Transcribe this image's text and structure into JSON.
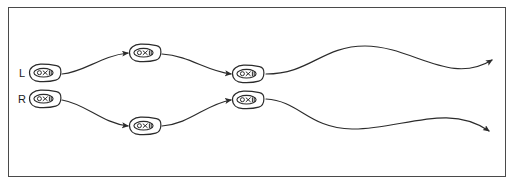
{
  "figure": {
    "background_color": "#ffffff",
    "stroke_color": "#2b2b2b",
    "frame_color": "#4a4a4a",
    "frame": {
      "x": 8,
      "y": 7,
      "width": 498,
      "height": 170
    }
  },
  "labels": {
    "left_input": "L",
    "right_input": "R"
  },
  "nodes": [
    {
      "id": "node-input-l",
      "name": "input-node-l",
      "cx": 45,
      "cy": 73,
      "rx": 15,
      "ry": 8
    },
    {
      "id": "node-input-r",
      "name": "input-node-r",
      "cx": 45,
      "cy": 99,
      "rx": 15,
      "ry": 8
    },
    {
      "id": "node-hidden-top",
      "name": "hidden-node-top",
      "cx": 145,
      "cy": 53,
      "rx": 15,
      "ry": 8
    },
    {
      "id": "node-hidden-bottom",
      "name": "hidden-node-bottom",
      "cx": 145,
      "cy": 126,
      "rx": 15,
      "ry": 8
    },
    {
      "id": "node-output-top",
      "name": "output-node-top",
      "cx": 248,
      "cy": 74,
      "rx": 15,
      "ry": 8
    },
    {
      "id": "node-output-bottom",
      "name": "output-node-bottom",
      "cx": 248,
      "cy": 100,
      "rx": 15,
      "ry": 8
    }
  ],
  "edges": [
    {
      "id": "edge-l-to-hidden-top",
      "name": "edge-input-l-to-hidden-top",
      "path": "M 62 74 C 85 72 100 56 128 53",
      "arrow": true
    },
    {
      "id": "edge-r-to-hidden-bottom",
      "name": "edge-input-r-to-hidden-bottom",
      "path": "M 62 100 C 86 104 102 123 128 126",
      "arrow": true
    },
    {
      "id": "edge-hidden-top-to-out",
      "name": "edge-hidden-top-to-output-top",
      "path": "M 162 54 C 190 56 206 71 231 74",
      "arrow": true
    },
    {
      "id": "edge-hidden-bot-to-out",
      "name": "edge-hidden-bottom-to-output-bottom",
      "path": "M 162 126 C 190 124 206 104 231 100",
      "arrow": true
    },
    {
      "id": "edge-out-top-long",
      "name": "edge-output-top-to-exit-top",
      "path": "M 266 74 C 310 74 322 46 365 46 C 412 46 450 86 492 60",
      "arrow": true
    },
    {
      "id": "edge-out-bot-long",
      "name": "edge-output-bottom-to-exit-bottom",
      "path": "M 266 99 C 300 101 308 128 352 129 C 400 130 448 102 489 131",
      "arrow": true
    }
  ]
}
